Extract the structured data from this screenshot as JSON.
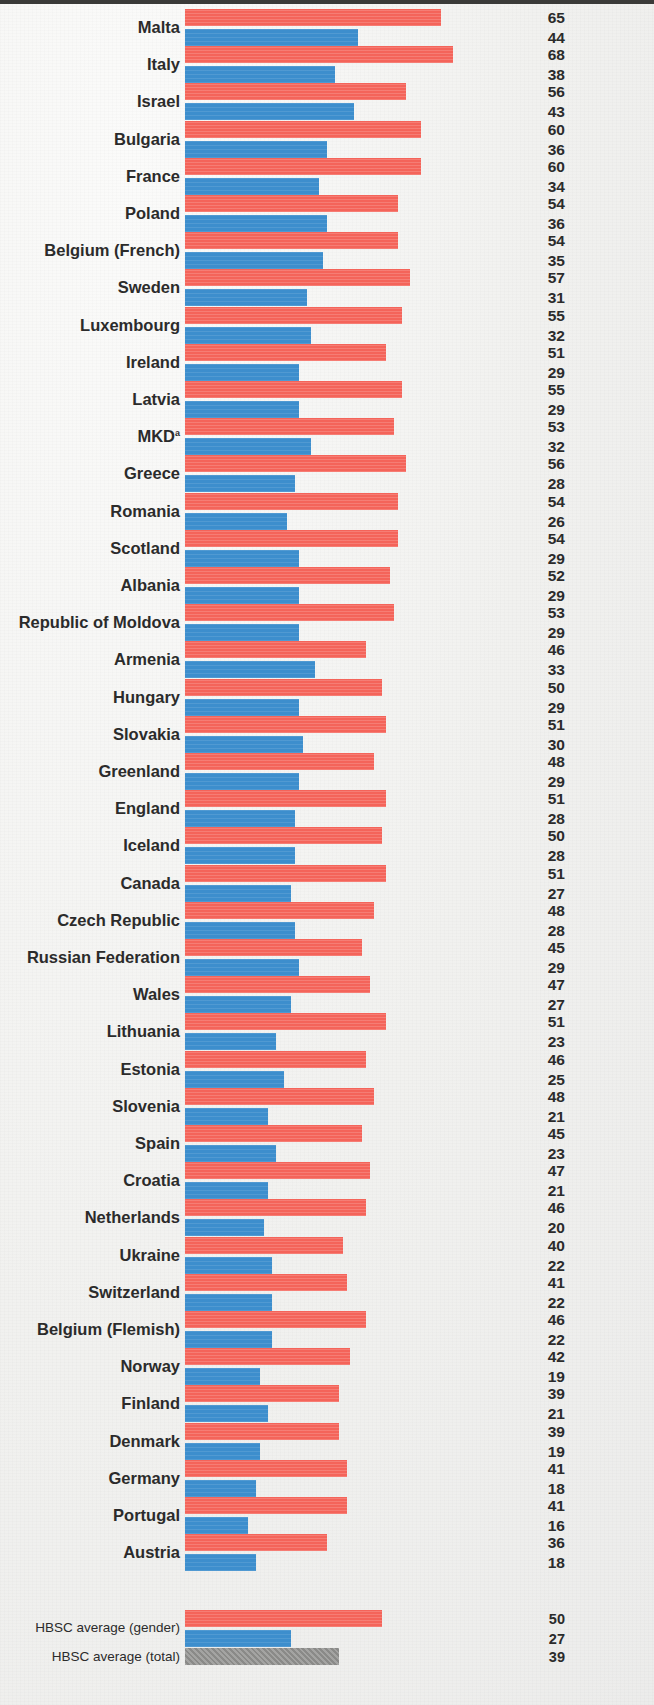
{
  "figure": {
    "colors": {
      "boys": "#f4645a",
      "girls": "#3d8ecd",
      "total": "#8a8a88",
      "label_text": "#2b2b2b",
      "page_background": "#f1f1ef",
      "top_rule": "#3a3a38"
    },
    "footnote_marker": "a"
  },
  "chart_data": {
    "type": "bar",
    "orientation": "horizontal",
    "title": "",
    "subtitle": "",
    "xlabel": "",
    "ylabel": "",
    "xlim": [
      0,
      70
    ],
    "grid": false,
    "legend_position": "none",
    "value_label_position": "right-column",
    "categories": [
      "Malta",
      "Italy",
      "Israel",
      "Bulgaria",
      "France",
      "Poland",
      "Belgium (French)",
      "Sweden",
      "Luxembourg",
      "Ireland",
      "Latvia",
      "MKD",
      "Greece",
      "Romania",
      "Scotland",
      "Albania",
      "Republic of Moldova",
      "Armenia",
      "Hungary",
      "Slovakia",
      "Greenland",
      "England",
      "Iceland",
      "Canada",
      "Czech Republic",
      "Russian Federation",
      "Wales",
      "Lithuania",
      "Estonia",
      "Slovenia",
      "Spain",
      "Croatia",
      "Netherlands",
      "Ukraine",
      "Switzerland",
      "Belgium (Flemish)",
      "Norway",
      "Finland",
      "Denmark",
      "Germany",
      "Portugal",
      "Austria"
    ],
    "series": [
      {
        "name": "boys",
        "color": "#f4645a",
        "values": [
          65,
          68,
          56,
          60,
          60,
          54,
          54,
          57,
          55,
          51,
          55,
          53,
          56,
          54,
          54,
          52,
          53,
          46,
          50,
          51,
          48,
          51,
          50,
          51,
          48,
          45,
          47,
          51,
          46,
          48,
          45,
          47,
          46,
          40,
          41,
          46,
          42,
          39,
          39,
          41,
          41,
          36
        ]
      },
      {
        "name": "girls",
        "color": "#3d8ecd",
        "values": [
          44,
          38,
          43,
          36,
          34,
          36,
          35,
          31,
          32,
          29,
          29,
          32,
          28,
          26,
          29,
          29,
          29,
          33,
          29,
          30,
          29,
          28,
          28,
          27,
          28,
          29,
          27,
          23,
          25,
          21,
          23,
          21,
          20,
          22,
          22,
          22,
          19,
          21,
          19,
          18,
          16,
          18
        ]
      }
    ],
    "averages": [
      {
        "label": "HBSC average (gender)",
        "type": "gender",
        "boys": 50,
        "girls": 27
      },
      {
        "label": "HBSC average (total)",
        "type": "total",
        "total": 39
      }
    ]
  }
}
